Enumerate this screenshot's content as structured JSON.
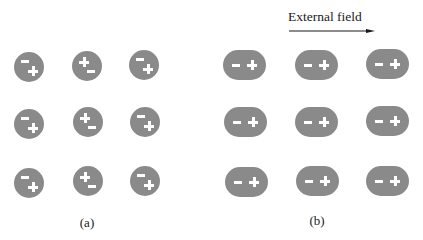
{
  "figure": {
    "panel_a": {
      "label": "(a)",
      "description": "Randomly oriented polar molecules (no field)",
      "molecules": [
        {
          "row": 0,
          "col": 0,
          "orientation": "minus-top-left, plus-bottom-right"
        },
        {
          "row": 0,
          "col": 1,
          "orientation": "plus-top-left, minus-bottom-right"
        },
        {
          "row": 0,
          "col": 2,
          "orientation": "minus-top-left, plus-bottom-right"
        },
        {
          "row": 1,
          "col": 0,
          "orientation": "minus-top-left, plus-bottom-right"
        },
        {
          "row": 1,
          "col": 1,
          "orientation": "plus-top-left, minus-bottom-right"
        },
        {
          "row": 1,
          "col": 2,
          "orientation": "minus-top-left, plus-bottom-right"
        },
        {
          "row": 2,
          "col": 0,
          "orientation": "minus-top-left, plus-bottom-right"
        },
        {
          "row": 2,
          "col": 1,
          "orientation": "plus-top-left, minus-bottom-right"
        },
        {
          "row": 2,
          "col": 2,
          "orientation": "minus-top-left, plus-bottom-right"
        }
      ]
    },
    "panel_b": {
      "label": "(b)",
      "description": "Aligned polar molecules in external field",
      "field_label": "External field",
      "arrow_direction": "right",
      "molecules": [
        {
          "row": 0,
          "col": 0,
          "orientation": "minus-left, plus-right"
        },
        {
          "row": 0,
          "col": 1,
          "orientation": "minus-left, plus-right"
        },
        {
          "row": 0,
          "col": 2,
          "orientation": "minus-left, plus-right"
        },
        {
          "row": 1,
          "col": 0,
          "orientation": "minus-left, plus-right"
        },
        {
          "row": 1,
          "col": 1,
          "orientation": "minus-left, plus-right"
        },
        {
          "row": 1,
          "col": 2,
          "orientation": "minus-left, plus-right"
        },
        {
          "row": 2,
          "col": 0,
          "orientation": "minus-left, plus-right"
        },
        {
          "row": 2,
          "col": 1,
          "orientation": "minus-left, plus-right"
        },
        {
          "row": 2,
          "col": 2,
          "orientation": "minus-left, plus-right"
        }
      ]
    },
    "colors": {
      "molecule_fill": "#8a8a8a",
      "sign_color": "#ffffff",
      "text_color": "#222222",
      "background": "#ffffff"
    }
  }
}
